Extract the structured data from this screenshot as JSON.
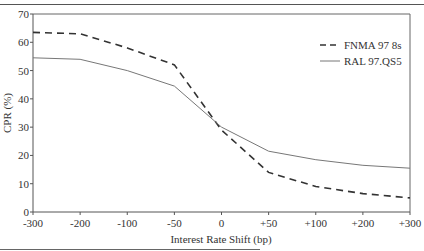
{
  "chart_data": {
    "type": "line",
    "title": "",
    "xlabel": "Interest Rate Shift (bp)",
    "ylabel": "CPR (%)",
    "categories": [
      "-300",
      "-200",
      "-100",
      "-50",
      "0",
      "+50",
      "+100",
      "+200",
      "+300"
    ],
    "ylim": [
      0,
      70
    ],
    "yticks": [
      0,
      10,
      20,
      30,
      40,
      50,
      60,
      70
    ],
    "grid": false,
    "legend_position": "upper right",
    "series": [
      {
        "name": "FNMA 97 8s",
        "style": "dashed",
        "color": "#333333",
        "values": [
          63.5,
          63,
          58,
          52,
          29,
          14,
          9,
          6.5,
          5
        ]
      },
      {
        "name": "RAL 97.QS5",
        "style": "solid",
        "color": "#666666",
        "values": [
          54.5,
          54,
          50,
          44.5,
          30,
          21.5,
          18.5,
          16.5,
          15.5
        ]
      }
    ]
  },
  "legend": {
    "items": [
      {
        "label": "FNMA 97 8s",
        "style": "dashed"
      },
      {
        "label": "RAL 97.QS5",
        "style": "solid"
      }
    ]
  },
  "axes": {
    "x_title": "Interest Rate Shift (bp)",
    "y_title": "CPR (%)"
  }
}
